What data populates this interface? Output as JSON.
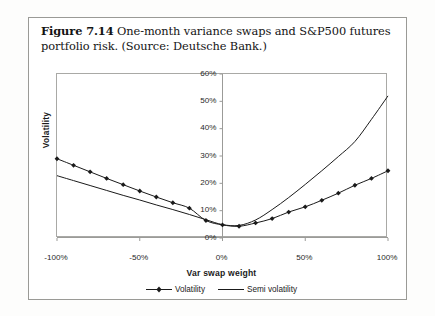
{
  "figure": {
    "number": "Figure 7.14",
    "caption_text": " One-month variance swaps and S&P500 futures portfolio risk. (Source: Deutsche Bank.)"
  },
  "chart_data": {
    "type": "line",
    "title": "",
    "xlabel": "Var swap weight",
    "ylabel": "Volatility",
    "xlim": [
      -100,
      100
    ],
    "ylim": [
      0,
      60
    ],
    "xtick_labels": [
      "-100%",
      "-50%",
      "0%",
      "50%",
      "100%"
    ],
    "xtick_values": [
      -100,
      -50,
      0,
      50,
      100
    ],
    "ytick_labels": [
      "0%",
      "10%",
      "20%",
      "30%",
      "40%",
      "50%",
      "60%"
    ],
    "ytick_values": [
      0,
      10,
      20,
      30,
      40,
      50,
      60
    ],
    "grid": false,
    "legend_position": "bottom-center",
    "x": [
      -100,
      -90,
      -80,
      -70,
      -60,
      -50,
      -40,
      -30,
      -20,
      -10,
      0,
      10,
      20,
      30,
      40,
      50,
      60,
      70,
      80,
      90,
      100
    ],
    "series": [
      {
        "name": "Volatility",
        "marker": "diamond",
        "color": "#1a1a1a",
        "values": [
          29.0,
          26.6,
          24.2,
          21.8,
          19.5,
          17.2,
          15.0,
          12.9,
          10.9,
          6.4,
          4.8,
          4.3,
          5.5,
          7.1,
          9.5,
          11.4,
          13.8,
          16.4,
          19.3,
          21.8,
          24.6
        ]
      },
      {
        "name": "Semi volatility",
        "marker": "none",
        "color": "#1a1a1a",
        "values": [
          22.8,
          21.0,
          19.2,
          17.4,
          15.6,
          13.9,
          12.1,
          10.4,
          8.6,
          6.7,
          4.9,
          4.6,
          6.6,
          10.4,
          14.8,
          19.6,
          24.6,
          29.8,
          35.3,
          43.4,
          52.0
        ]
      }
    ]
  },
  "legend": {
    "items": [
      {
        "label": "Volatility"
      },
      {
        "label": "Semi volatility"
      }
    ]
  }
}
